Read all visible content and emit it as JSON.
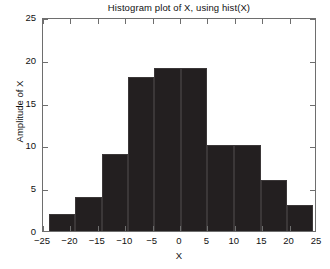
{
  "chart_data": {
    "type": "bar",
    "title": "Histogram plot of X, using hist(X)",
    "xlabel": "X",
    "ylabel": "Amplitude of X",
    "xlim": [
      -25,
      25
    ],
    "ylim": [
      0,
      25
    ],
    "grid": false,
    "legend": null,
    "bar_style": "histogram-contiguous",
    "bar_color": "#231f20",
    "xticks": [
      -25,
      -20,
      -15,
      -10,
      -5,
      0,
      5,
      10,
      15,
      20,
      25
    ],
    "xtick_labels": [
      "−25",
      "−20",
      "−15",
      "−10",
      "−5",
      "0",
      "5",
      "10",
      "15",
      "20",
      "25"
    ],
    "yticks": [
      0,
      5,
      10,
      15,
      20,
      25
    ],
    "ytick_labels": [
      "0",
      "5",
      "10",
      "15",
      "20",
      "25"
    ],
    "bin_edges": [
      -23.9,
      -19.2,
      -14.3,
      -9.5,
      -4.7,
      0.2,
      5.0,
      9.8,
      14.7,
      19.5,
      24.3
    ],
    "categories": [
      "-23.9 to -19.2",
      "-19.2 to -14.3",
      "-14.3 to -9.5",
      "-9.5 to -4.7",
      "-4.7 to 0.2",
      "0.2 to 5.0",
      "5.0 to 9.8",
      "9.8 to 14.7",
      "14.7 to 19.5",
      "19.5 to 24.3"
    ],
    "bin_centers": [
      -21.5,
      -16.8,
      -11.9,
      -7.1,
      -2.3,
      2.6,
      7.4,
      12.2,
      17.1,
      21.9
    ],
    "values": [
      2,
      4,
      9,
      18,
      19,
      19,
      10,
      10,
      6,
      3
    ]
  }
}
